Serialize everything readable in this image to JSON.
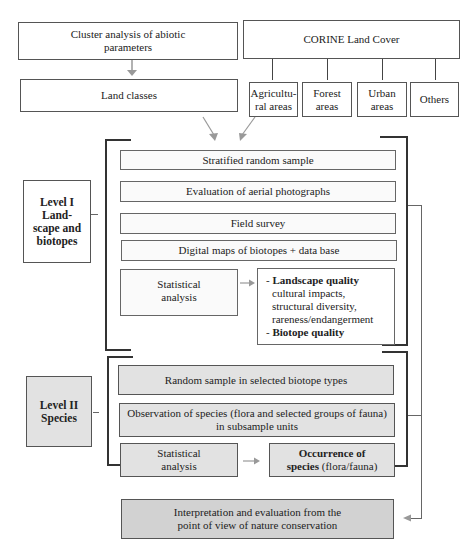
{
  "top_left": {
    "cluster_analysis": "Cluster analysis of abiotic parameters",
    "land_classes": "Land classes"
  },
  "corine": {
    "title": "CORINE Land Cover",
    "categories": [
      {
        "line1": "Agricultu-",
        "line2": "ral areas"
      },
      {
        "line1": "Forest",
        "line2": "areas"
      },
      {
        "line1": "Urban",
        "line2": "areas"
      },
      {
        "line1": "Others",
        "line2": ""
      }
    ]
  },
  "level1": {
    "label_line1": "Level I",
    "label_line2": "Land-",
    "label_line3": "scape and",
    "label_line4": "biotopes",
    "steps": [
      "Stratified random sample",
      "Evaluation of aerial photographs",
      "Field survey",
      "Digital maps of biotopes + data base"
    ],
    "stat_line1": "Statistical",
    "stat_line2": "analysis",
    "result": {
      "item1_prefix": "- ",
      "item1_bold": "Landscape quality",
      "item1_details": [
        "cultural impacts,",
        "structural diversity,",
        "rareness/endangerment"
      ],
      "item2_prefix": "- ",
      "item2_bold": "Biotope quality"
    }
  },
  "level2": {
    "label_line1": "Level II",
    "label_line2": "Species",
    "steps": [
      "Random sample in selected biotope types"
    ],
    "observation_line1": "Observation of species (flora and selected groups of fauna)",
    "observation_line2": "in subsample units",
    "stat_line1": "Statistical",
    "stat_line2": "analysis",
    "result_bold1": "Occurrence of",
    "result_bold2": "species",
    "result_normal": " (flora/fauna)"
  },
  "final": {
    "line1": "Interpretation and evaluation from the",
    "line2": "point of view of nature conservation"
  },
  "colors": {
    "level2_fill": "#e2e2e2",
    "final_fill": "#d2d2d2",
    "arrow": "#999999",
    "bracket": "#333333"
  }
}
